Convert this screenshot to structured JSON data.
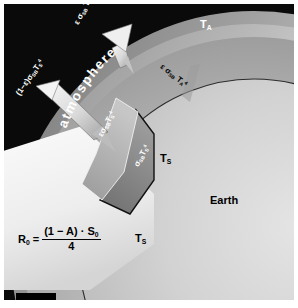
{
  "figure": {
    "background_color": "#000000",
    "earth_color": "#c9c9c9",
    "atmosphere_color": "#a8a8a8",
    "beam_color": "#f2f2f2",
    "label_white": "#ffffff",
    "label_black": "#000000"
  },
  "labels": {
    "atmosphere": "atmosphere",
    "earth": "Earth",
    "temp_atmosphere": {
      "base": "T",
      "sub": "A"
    },
    "temp_surface": {
      "base": "T",
      "sub": "S"
    }
  },
  "fluxes": [
    {
      "id": "atmosphere-emission-up",
      "base": "ε σ",
      "sub": "SB",
      "var": " T",
      "var_sub": "A",
      "sup": "4",
      "text": "ε σSB TA4",
      "color": "#ffffff",
      "direction": "up"
    },
    {
      "id": "surface-reflected-window",
      "base": "(1−ε)σ",
      "sub": "SB",
      "var": "T",
      "var_sub": "S",
      "sup": "4",
      "text": "(1−ε)σSB TS4",
      "color": "#ffffff",
      "direction": "up-left"
    },
    {
      "id": "atmosphere-emission-down",
      "base": "ε σ",
      "sub": "SB",
      "var": " T",
      "var_sub": "A",
      "sup": "4",
      "text": "ε σSB TA4",
      "color": "#000000",
      "direction": "down"
    },
    {
      "id": "surface-emission-absorbed",
      "base": "εσ",
      "sub": "SB",
      "var": "T",
      "var_sub": "S",
      "sup": "4",
      "text": "εσSB TS4",
      "color": "#ffffff",
      "direction": "up"
    },
    {
      "id": "surface-emission-total",
      "base": "σ",
      "sub": "SB",
      "var": "T",
      "var_sub": "S",
      "sup": "4",
      "text": "σSB TS4",
      "color": "#ffffff",
      "direction": "up"
    }
  ],
  "formula": {
    "id": "incoming-solar-radiation",
    "lhs_base": "R",
    "lhs_sub": "0",
    "equals": "=",
    "numerator_a": "(1 − A) · S",
    "numerator_sub": "0",
    "denominator": "4"
  },
  "scale_bar": {
    "present": true
  }
}
